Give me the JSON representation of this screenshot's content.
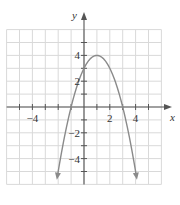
{
  "chart_data": {
    "type": "line",
    "title": "",
    "xlabel": "x",
    "ylabel": "y",
    "xlim": [
      -6,
      6
    ],
    "ylim": [
      -6,
      6
    ],
    "grid": true,
    "x_tick_labels": [
      {
        "value": -4,
        "label": "−4"
      },
      {
        "value": 2,
        "label": "2"
      },
      {
        "value": 4,
        "label": "4"
      }
    ],
    "y_tick_labels": [
      {
        "value": 4,
        "label": "4"
      },
      {
        "value": 2,
        "label": "2"
      },
      {
        "value": -2,
        "label": "−2"
      },
      {
        "value": -4,
        "label": "−4"
      }
    ],
    "series": [
      {
        "name": "parabola",
        "equation": "y = -x^2 + 2x + 3",
        "vertex": [
          1,
          4
        ],
        "y_intercept": 3,
        "x_intercepts": [
          -1,
          3
        ],
        "x": [
          -2.16,
          -2,
          -1,
          0,
          1,
          2,
          3,
          4,
          4.16
        ],
        "values": [
          -6,
          -5,
          0,
          3,
          4,
          3,
          0,
          -5,
          -6
        ],
        "arrows_at_ends": true
      }
    ]
  },
  "colors": {
    "grid": "#d9d9d9",
    "axis": "#555555",
    "curve": "#8a8a8a"
  }
}
